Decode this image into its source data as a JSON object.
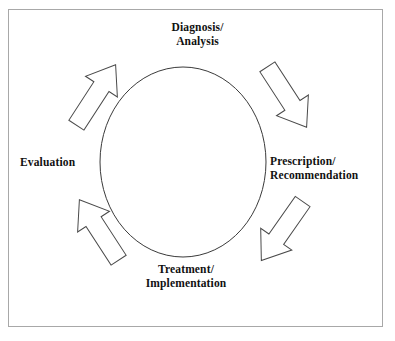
{
  "diagram": {
    "background_color": "#ffffff",
    "border_color": "#a8a8a8",
    "stroke_color": "#333333",
    "shape_fill": "#ffffff",
    "direction": "clockwise",
    "center_shape": "ellipse",
    "labels": [
      {
        "id": "diagnosis",
        "position": "top",
        "line1": "Diagnosis/",
        "line2": "Analysis"
      },
      {
        "id": "prescription",
        "position": "right",
        "line1": "Prescription/",
        "line2": "Recommendation"
      },
      {
        "id": "treatment",
        "position": "bottom",
        "line1": "Treatment/",
        "line2": "Implementation"
      },
      {
        "id": "evaluation",
        "position": "left",
        "line1": "Evaluation",
        "line2": ""
      }
    ],
    "arrows": [
      {
        "id": "arrow-nw",
        "name": "arrow-evaluation-to-diagnosis",
        "points_toward": "Diagnosis/Analysis",
        "direction": "up-right"
      },
      {
        "id": "arrow-ne",
        "name": "arrow-diagnosis-to-prescription",
        "points_toward": "Prescription/Recommendation",
        "direction": "down-right"
      },
      {
        "id": "arrow-se",
        "name": "arrow-prescription-to-treatment",
        "points_toward": "Treatment/Implementation",
        "direction": "down-left"
      },
      {
        "id": "arrow-sw",
        "name": "arrow-treatment-to-evaluation",
        "points_toward": "Evaluation",
        "direction": "up-left"
      }
    ]
  }
}
